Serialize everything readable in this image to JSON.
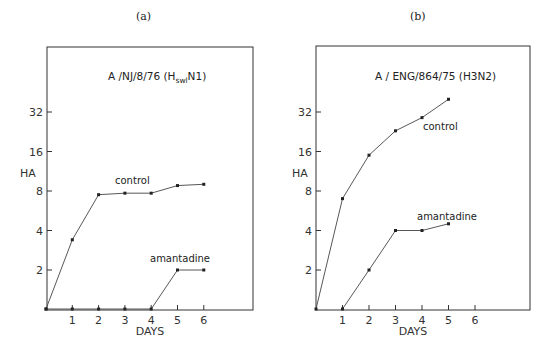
{
  "chart_data": [
    {
      "type": "line",
      "panel_label": "(a)",
      "title": "A/NJ/8/76 (H_swl N1)",
      "title_main": "A /NJ/8/76 (H",
      "title_sub": "swl",
      "title_end": "N1)",
      "xlabel": "DAYS",
      "ylabel": "HA",
      "y_scale": "log2",
      "y_ticks": [
        2,
        4,
        8,
        16,
        32
      ],
      "x_ticks": [
        1,
        2,
        3,
        4,
        5,
        6
      ],
      "xlim": [
        0,
        8
      ],
      "grid": false,
      "legend_position": "inline labels",
      "series": [
        {
          "name": "control",
          "x": [
            0,
            1,
            2,
            3,
            4,
            5,
            6
          ],
          "values": [
            0,
            3.4,
            7.5,
            7.7,
            7.7,
            8.8,
            9
          ]
        },
        {
          "name": "amantadine",
          "x": [
            0,
            1,
            2,
            3,
            4,
            5,
            6
          ],
          "values": [
            0,
            0,
            0,
            0,
            0,
            2,
            2
          ]
        }
      ]
    },
    {
      "type": "line",
      "panel_label": "(b)",
      "title": "A/ENG/864/75 (H3N2)",
      "title_main": "A / ENG/864/75 (H3N2)",
      "xlabel": "DAYS",
      "ylabel": "HA",
      "y_scale": "log2",
      "y_ticks": [
        2,
        4,
        8,
        16,
        32
      ],
      "x_ticks": [
        1,
        2,
        3,
        4,
        5,
        6
      ],
      "xlim": [
        0,
        8
      ],
      "grid": false,
      "legend_position": "inline labels",
      "series": [
        {
          "name": "control",
          "x": [
            0,
            1,
            2,
            3,
            4,
            5
          ],
          "values": [
            0,
            7,
            15,
            23,
            29,
            40
          ]
        },
        {
          "name": "amantadine",
          "x": [
            1,
            2,
            3,
            4,
            5
          ],
          "values": [
            0,
            2,
            4,
            4,
            4.5
          ]
        }
      ]
    }
  ],
  "layout": [
    {
      "frame": {
        "left": 47,
        "right": 253,
        "top": 47,
        "bottom": 310
      },
      "x_pixel_per_day": 26.3,
      "x0": 46,
      "y_at_2": 270,
      "y_per_doubling": 39.5,
      "panel_label_pos": [
        136,
        20
      ],
      "title_pos": [
        108,
        80
      ],
      "ylabel_pos": [
        20,
        177
      ],
      "xlabel_pos": [
        150,
        335
      ],
      "control_label_pos": [
        115,
        184
      ],
      "amantadine_label_pos": [
        150,
        262
      ]
    },
    {
      "frame": {
        "left": 316,
        "right": 530,
        "top": 46,
        "bottom": 310
      },
      "x_pixel_per_day": 26.5,
      "x0": 316,
      "y_at_2": 270,
      "y_per_doubling": 39.5,
      "panel_label_pos": [
        410,
        20
      ],
      "title_pos": [
        375,
        80
      ],
      "ylabel_pos": [
        292,
        177
      ],
      "xlabel_pos": [
        413,
        335
      ],
      "control_label_pos": [
        423,
        130
      ],
      "amantadine_label_pos": [
        417,
        220
      ]
    }
  ]
}
